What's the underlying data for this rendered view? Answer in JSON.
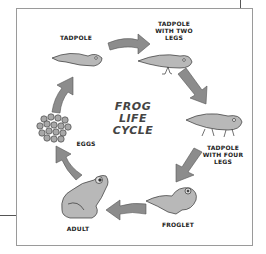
{
  "diagram": {
    "title_lines": [
      "FROG",
      "LIFE",
      "CYCLE"
    ],
    "stages": [
      {
        "id": "tadpole",
        "label_lines": [
          "TADPOLE"
        ]
      },
      {
        "id": "tadpole-two-legs",
        "label_lines": [
          "TADPOLE",
          "WITH TWO",
          "LEGS"
        ]
      },
      {
        "id": "tadpole-four-legs",
        "label_lines": [
          "TADPOLE",
          "WITH FOUR",
          "LEGS"
        ]
      },
      {
        "id": "froglet",
        "label_lines": [
          "FROGLET"
        ]
      },
      {
        "id": "adult",
        "label_lines": [
          "ADULT"
        ]
      },
      {
        "id": "eggs",
        "label_lines": [
          "EGGS"
        ]
      }
    ],
    "colors": {
      "arrow": "#8c8c8c",
      "creature": "#b8b8b8",
      "outline": "#333333",
      "frame": "#9a9a9a"
    }
  }
}
